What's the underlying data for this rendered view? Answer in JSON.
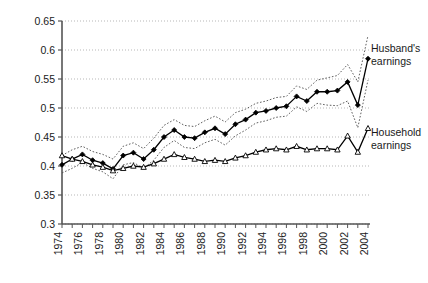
{
  "chart_data": {
    "type": "line",
    "title": "",
    "xlabel": "",
    "ylabel": "",
    "xlim": [
      1974,
      2004
    ],
    "ylim": [
      0.3,
      0.65
    ],
    "ytick_step": 0.05,
    "xtick_step": 1,
    "xticklabel_step": 2,
    "grid": true,
    "grid_axis": "y",
    "legend_position": "right-inline-annotations",
    "yticks": [
      "0.3",
      "0.35",
      "0.4",
      "0.45",
      "0.5",
      "0.55",
      "0.6",
      "0.65"
    ],
    "ytick_values": [
      0.3,
      0.35,
      0.4,
      0.45,
      0.5,
      0.55,
      0.6,
      0.65
    ],
    "xticks": [
      "1974",
      "1976",
      "1978",
      "1980",
      "1982",
      "1984",
      "1986",
      "1988",
      "1990",
      "1992",
      "1994",
      "1996",
      "1998",
      "2000",
      "2002",
      "2004"
    ],
    "x": [
      1974,
      1975,
      1976,
      1977,
      1978,
      1979,
      1980,
      1981,
      1982,
      1983,
      1984,
      1985,
      1986,
      1987,
      1988,
      1989,
      1990,
      1991,
      1992,
      1993,
      1994,
      1995,
      1996,
      1997,
      1998,
      1999,
      2000,
      2001,
      2002,
      2003,
      2004
    ],
    "series": [
      {
        "name": "Husband's earnings",
        "marker": "filled-diamond",
        "values": [
          0.402,
          0.412,
          0.42,
          0.41,
          0.405,
          0.395,
          0.418,
          0.423,
          0.412,
          0.428,
          0.45,
          0.462,
          0.45,
          0.448,
          0.458,
          0.465,
          0.455,
          0.472,
          0.48,
          0.492,
          0.495,
          0.5,
          0.503,
          0.52,
          0.512,
          0.528,
          0.528,
          0.53,
          0.545,
          0.505,
          0.585
        ],
        "ci_upper": [
          0.418,
          0.428,
          0.434,
          0.425,
          0.42,
          0.412,
          0.434,
          0.44,
          0.43,
          0.448,
          0.47,
          0.48,
          0.47,
          0.468,
          0.478,
          0.486,
          0.476,
          0.492,
          0.498,
          0.508,
          0.512,
          0.518,
          0.52,
          0.538,
          0.532,
          0.548,
          0.552,
          0.556,
          0.575,
          0.545,
          0.625
        ],
        "ci_lower": [
          0.388,
          0.396,
          0.406,
          0.396,
          0.39,
          0.378,
          0.402,
          0.406,
          0.396,
          0.41,
          0.432,
          0.444,
          0.432,
          0.43,
          0.44,
          0.446,
          0.436,
          0.452,
          0.462,
          0.474,
          0.478,
          0.484,
          0.486,
          0.502,
          0.494,
          0.508,
          0.505,
          0.504,
          0.512,
          0.466,
          0.548
        ]
      },
      {
        "name": "Household earnings",
        "marker": "open-triangle",
        "values": [
          0.418,
          0.412,
          0.408,
          0.402,
          0.398,
          0.392,
          0.396,
          0.4,
          0.398,
          0.404,
          0.412,
          0.42,
          0.415,
          0.412,
          0.408,
          0.41,
          0.408,
          0.414,
          0.418,
          0.424,
          0.428,
          0.43,
          0.428,
          0.434,
          0.428,
          0.43,
          0.43,
          0.428,
          0.452,
          0.424,
          0.465
        ]
      }
    ],
    "annotations": [
      {
        "text_line1": "Husband's",
        "text_line2": "earnings",
        "target_series": "Husband's earnings"
      },
      {
        "text_line1": "Household",
        "text_line2": "earnings",
        "target_series": "Household earnings"
      }
    ]
  },
  "labels": {
    "husband_line1": "Husband's",
    "husband_line2": "earnings",
    "household_line1": "Household",
    "household_line2": "earnings"
  },
  "colors": {
    "line": "#000000",
    "grid": "#9a9a9a",
    "axis": "#555555",
    "text": "#1a1a1a",
    "band": "#4d4d4d"
  }
}
